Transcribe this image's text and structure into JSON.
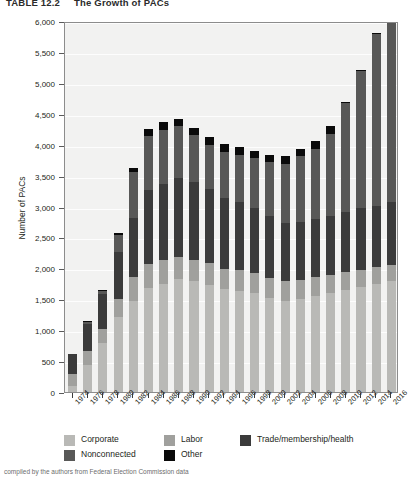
{
  "title": {
    "label": "TABLE 12.2",
    "text": "The Growth of PACs"
  },
  "caption": {
    "text": "compiled by the authors from Federal Election Commission data"
  },
  "axis": {
    "ylabel": "Number of PACs",
    "yticks": [
      "0",
      "500",
      "1,000",
      "1,500",
      "2,000",
      "2,500",
      "3,000",
      "3,500",
      "4,000",
      "4,500",
      "5,000",
      "5,500",
      "6,000"
    ],
    "ytick_values": [
      0,
      500,
      1000,
      1500,
      2000,
      2500,
      3000,
      3500,
      4000,
      4500,
      5000,
      5500,
      6000
    ]
  },
  "legend": {
    "items": [
      {
        "label": "Corporate",
        "color": "#b9b9b6"
      },
      {
        "label": "Labor",
        "color": "#a0a09d"
      },
      {
        "label": "Trade/membership/health",
        "color": "#3b3b3b"
      },
      {
        "label": "Nonconnected",
        "color": "#585857"
      },
      {
        "label": "Other",
        "color": "#0a0a0a"
      }
    ]
  },
  "chart_data": {
    "type": "bar",
    "subtype": "stacked-vertical",
    "title": "The Growth of PACs",
    "xlabel": "",
    "ylabel": "Number of PACs",
    "ylim": [
      0,
      6000
    ],
    "ytick_step": 500,
    "grid": true,
    "legend_position": "bottom-left",
    "categories": [
      "1974",
      "1976",
      "1978",
      "1980",
      "1982",
      "1984",
      "1986",
      "1988",
      "1990",
      "1992",
      "1994",
      "1996",
      "1998",
      "2000",
      "2002",
      "2004",
      "2006",
      "2008",
      "2010",
      "2012",
      "2014",
      "2016"
    ],
    "series": [
      {
        "name": "Corporate",
        "color": "#b9b9b6",
        "values": [
          90,
          430,
          800,
          1210,
          1470,
          1680,
          1740,
          1820,
          1795,
          1735,
          1660,
          1640,
          1600,
          1520,
          1480,
          1510,
          1560,
          1600,
          1650,
          1700,
          1740,
          1790
        ]
      },
      {
        "name": "Labor",
        "color": "#a0a09d",
        "values": [
          200,
          230,
          220,
          300,
          390,
          395,
          390,
          370,
          345,
          345,
          335,
          330,
          325,
          320,
          310,
          300,
          295,
          290,
          285,
          280,
          275,
          270
        ]
      },
      {
        "name": "Trade/membership/health",
        "color": "#3b3b3b",
        "values": [
          320,
          440,
          560,
          750,
          960,
          1200,
          1240,
          1275,
          1260,
          1200,
          1150,
          1110,
          1050,
          1000,
          950,
          940,
          940,
          960,
          980,
          995,
          1000,
          1010
        ]
      },
      {
        "name": "Nonconnected",
        "color": "#585857",
        "values": [
          0,
          30,
          50,
          280,
          745,
          865,
          870,
          830,
          750,
          720,
          740,
          760,
          810,
          880,
          950,
          1060,
          1140,
          1330,
          1760,
          2220,
          2770,
          3410
        ]
      },
      {
        "name": "Other",
        "color": "#0a0a0a",
        "values": [
          0,
          20,
          20,
          30,
          65,
          110,
          120,
          125,
          120,
          120,
          120,
          120,
          120,
          120,
          120,
          120,
          120,
          120,
          15,
          15,
          15,
          120
        ]
      }
    ],
    "totals": [
      610,
      1150,
      1650,
      2570,
      3630,
      4250,
      4360,
      4420,
      4270,
      4120,
      4005,
      3960,
      3905,
      3840,
      3810,
      3930,
      4055,
      4300,
      4690,
      5210,
      5800,
      6600
    ],
    "annotations": []
  }
}
